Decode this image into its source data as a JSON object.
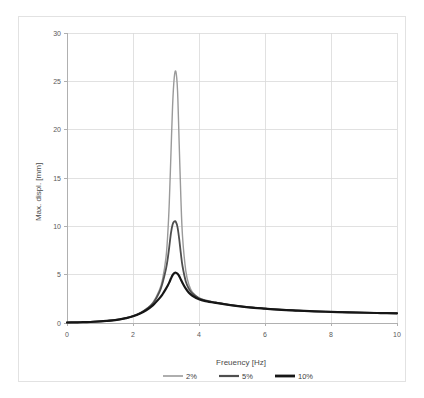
{
  "chart_data": {
    "type": "line",
    "title": "",
    "xlabel": "Freuency [Hz]",
    "ylabel": "Max. displ. [mm]",
    "xlim": [
      0,
      10
    ],
    "ylim": [
      0,
      30
    ],
    "xticks": [
      0,
      2,
      4,
      6,
      8,
      10
    ],
    "yticks": [
      0,
      5,
      10,
      15,
      20,
      25,
      30
    ],
    "xtick_labels": [
      "0",
      "2",
      "4",
      "6",
      "8",
      "10"
    ],
    "ytick_labels": [
      "0",
      "5",
      "10",
      "15",
      "20",
      "25",
      "30"
    ],
    "grid": "both",
    "legend_position": "bottom",
    "series": [
      {
        "name": "2%",
        "color": "#9a9a9a",
        "width": 1.4,
        "peak_x": 3.3,
        "peak_y": 26.0,
        "x": [
          0.0,
          0.2,
          0.4,
          0.6,
          0.8,
          1.0,
          1.2,
          1.4,
          1.6,
          1.8,
          2.0,
          2.2,
          2.4,
          2.6,
          2.8,
          2.9,
          3.0,
          3.05,
          3.1,
          3.15,
          3.2,
          3.25,
          3.3,
          3.35,
          3.4,
          3.45,
          3.5,
          3.6,
          3.7,
          3.8,
          4.0,
          4.2,
          4.5,
          5.0,
          5.5,
          6.0,
          6.5,
          7.0,
          7.5,
          8.0,
          8.5,
          9.0,
          9.5,
          10.0
        ],
        "y": [
          0.05,
          0.06,
          0.08,
          0.1,
          0.13,
          0.17,
          0.22,
          0.29,
          0.38,
          0.52,
          0.72,
          1.0,
          1.45,
          2.1,
          3.4,
          4.6,
          6.8,
          9.0,
          12.5,
          17.5,
          22.5,
          25.4,
          26.0,
          24.0,
          18.5,
          13.0,
          9.0,
          5.4,
          3.9,
          3.2,
          2.6,
          2.35,
          2.15,
          1.85,
          1.65,
          1.5,
          1.38,
          1.3,
          1.22,
          1.17,
          1.12,
          1.08,
          1.05,
          1.02
        ]
      },
      {
        "name": "5%",
        "color": "#4f4f4f",
        "width": 1.8,
        "peak_x": 3.3,
        "peak_y": 10.5,
        "x": [
          0.0,
          0.2,
          0.4,
          0.6,
          0.8,
          1.0,
          1.2,
          1.4,
          1.6,
          1.8,
          2.0,
          2.2,
          2.4,
          2.6,
          2.8,
          2.9,
          3.0,
          3.05,
          3.1,
          3.15,
          3.2,
          3.25,
          3.3,
          3.35,
          3.4,
          3.45,
          3.5,
          3.6,
          3.7,
          3.8,
          4.0,
          4.2,
          4.5,
          5.0,
          5.5,
          6.0,
          6.5,
          7.0,
          7.5,
          8.0,
          8.5,
          9.0,
          9.5,
          10.0
        ],
        "y": [
          0.05,
          0.06,
          0.08,
          0.1,
          0.13,
          0.17,
          0.22,
          0.29,
          0.38,
          0.52,
          0.72,
          1.0,
          1.42,
          2.0,
          3.2,
          4.2,
          5.6,
          6.6,
          7.9,
          9.3,
          10.2,
          10.5,
          10.45,
          9.9,
          8.7,
          7.2,
          5.9,
          4.3,
          3.5,
          3.05,
          2.55,
          2.32,
          2.12,
          1.84,
          1.64,
          1.49,
          1.37,
          1.29,
          1.21,
          1.16,
          1.11,
          1.07,
          1.04,
          1.01
        ]
      },
      {
        "name": "10%",
        "color": "#161616",
        "width": 2.2,
        "peak_x": 3.3,
        "peak_y": 5.2,
        "x": [
          0.0,
          0.2,
          0.4,
          0.6,
          0.8,
          1.0,
          1.2,
          1.4,
          1.6,
          1.8,
          2.0,
          2.2,
          2.4,
          2.6,
          2.8,
          2.9,
          3.0,
          3.05,
          3.1,
          3.15,
          3.2,
          3.25,
          3.3,
          3.35,
          3.4,
          3.45,
          3.5,
          3.6,
          3.7,
          3.8,
          4.0,
          4.2,
          4.5,
          5.0,
          5.5,
          6.0,
          6.5,
          7.0,
          7.5,
          8.0,
          8.5,
          9.0,
          9.5,
          10.0
        ],
        "y": [
          0.05,
          0.06,
          0.08,
          0.1,
          0.13,
          0.17,
          0.22,
          0.28,
          0.37,
          0.5,
          0.7,
          0.96,
          1.32,
          1.82,
          2.55,
          3.0,
          3.55,
          3.85,
          4.2,
          4.6,
          4.95,
          5.15,
          5.2,
          5.1,
          4.85,
          4.5,
          4.15,
          3.55,
          3.1,
          2.82,
          2.45,
          2.26,
          2.08,
          1.82,
          1.62,
          1.48,
          1.36,
          1.28,
          1.2,
          1.15,
          1.1,
          1.06,
          1.03,
          1.0
        ]
      }
    ]
  },
  "legend": {
    "items": [
      {
        "label": "2%",
        "color": "#9a9a9a",
        "width": 1.6
      },
      {
        "label": "5%",
        "color": "#4f4f4f",
        "width": 2.2
      },
      {
        "label": "10%",
        "color": "#161616",
        "width": 2.8
      }
    ]
  },
  "colors": {
    "background": "#ffffff",
    "card_border": "#e2e2e2",
    "axis": "#b0b0b0",
    "grid": "#d9d9d9",
    "tick_text": "#5a5a5a",
    "title_text": "#4a4a4a"
  }
}
